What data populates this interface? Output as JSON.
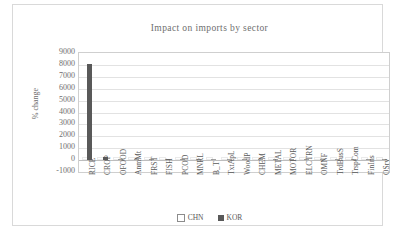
{
  "chart_data": {
    "type": "bar",
    "title": "Impact on imports by sector",
    "xlabel": "",
    "ylabel": "% change",
    "ylim": [
      -1000,
      9000
    ],
    "ytick_step": 1000,
    "yticks": [
      "9000",
      "8000",
      "7000",
      "6000",
      "5000",
      "4000",
      "3000",
      "2000",
      "1000",
      "0",
      "-1000"
    ],
    "grid": true,
    "legend_position": "bottom-center",
    "categories": [
      "RICE",
      "CROP",
      "OFOOD",
      "AnmMt",
      "FRST",
      "FISH",
      "PCOD",
      "MNRL",
      "B_T",
      "TxtApL",
      "WoodP",
      "CHEM",
      "METAL",
      "MOTOR",
      "ELCTRN",
      "OMNF",
      "TrdBusS",
      "TrspCom",
      "FinIns",
      "OSrv"
    ],
    "series": [
      {
        "name": "CHN",
        "color": "#ffffff",
        "values": [
          0,
          0,
          0,
          0,
          0,
          0,
          0,
          0,
          0,
          0,
          0,
          0,
          0,
          0,
          0,
          0,
          0,
          0,
          0,
          0
        ]
      },
      {
        "name": "KOR",
        "color": "#595959",
        "values": [
          8100,
          250,
          0,
          0,
          0,
          0,
          0,
          0,
          0,
          0,
          0,
          0,
          0,
          0,
          0,
          0,
          0,
          0,
          0,
          0
        ]
      }
    ]
  },
  "legend": {
    "items": [
      {
        "label": "CHN"
      },
      {
        "label": "KOR"
      }
    ]
  }
}
